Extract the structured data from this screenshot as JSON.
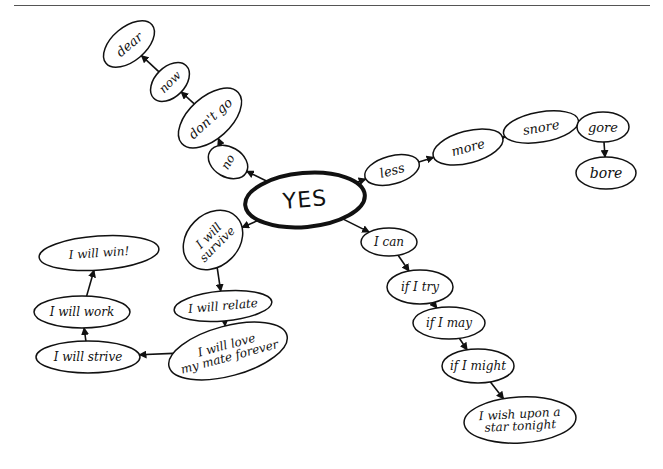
{
  "diagram": {
    "type": "mind-map",
    "style": "hand-drawn",
    "root": {
      "id": "yes",
      "label": "YES"
    },
    "colors": {
      "ink": "#111111",
      "background": "#ffffff",
      "rule": "#555555"
    },
    "nodes": [
      {
        "id": "yes",
        "label": "YES",
        "cx": 305,
        "cy": 200,
        "rx": 60,
        "ry": 27,
        "rot": -5,
        "font": 22,
        "root": true
      },
      {
        "id": "no",
        "label": "no",
        "cx": 228,
        "cy": 162,
        "rx": 15,
        "ry": 21,
        "rot": -60,
        "font": 12
      },
      {
        "id": "dont-go",
        "label": "don't go",
        "cx": 210,
        "cy": 118,
        "rx": 38,
        "ry": 21,
        "rot": -42,
        "font": 13
      },
      {
        "id": "now",
        "label": "now",
        "cx": 170,
        "cy": 82,
        "rx": 23,
        "ry": 15,
        "rot": -45,
        "font": 12
      },
      {
        "id": "dear",
        "label": "dear",
        "cx": 129,
        "cy": 44,
        "rx": 30,
        "ry": 17,
        "rot": -40,
        "font": 13
      },
      {
        "id": "less",
        "label": "less",
        "cx": 392,
        "cy": 170,
        "rx": 28,
        "ry": 14,
        "rot": -15,
        "font": 13
      },
      {
        "id": "more",
        "label": "more",
        "cx": 468,
        "cy": 147,
        "rx": 36,
        "ry": 16,
        "rot": -15,
        "font": 13
      },
      {
        "id": "snore",
        "label": "snore",
        "cx": 541,
        "cy": 127,
        "rx": 38,
        "ry": 15,
        "rot": -10,
        "font": 13
      },
      {
        "id": "gore",
        "label": "gore",
        "cx": 603,
        "cy": 127,
        "rx": 26,
        "ry": 15,
        "rot": 0,
        "font": 13
      },
      {
        "id": "bore",
        "label": "bore",
        "cx": 606,
        "cy": 173,
        "rx": 30,
        "ry": 16,
        "rot": 0,
        "font": 14
      },
      {
        "id": "i-can",
        "label": "I can",
        "cx": 389,
        "cy": 242,
        "rx": 28,
        "ry": 14,
        "rot": 0,
        "font": 12
      },
      {
        "id": "if-i-try",
        "label": "if I try",
        "cx": 420,
        "cy": 287,
        "rx": 33,
        "ry": 17,
        "rot": 0,
        "font": 12
      },
      {
        "id": "if-i-may",
        "label": "if I may",
        "cx": 449,
        "cy": 323,
        "rx": 36,
        "ry": 16,
        "rot": 0,
        "font": 12
      },
      {
        "id": "if-i-might",
        "label": "if I might",
        "cx": 478,
        "cy": 366,
        "rx": 36,
        "ry": 17,
        "rot": 0,
        "font": 12
      },
      {
        "id": "wish",
        "label": "I wish upon a\nstar tonight",
        "cx": 520,
        "cy": 420,
        "rx": 56,
        "ry": 23,
        "rot": -3,
        "font": 12
      },
      {
        "id": "survive",
        "label": "I will\nsurvive",
        "cx": 213,
        "cy": 240,
        "rx": 33,
        "ry": 26,
        "rot": -45,
        "font": 12
      },
      {
        "id": "relate",
        "label": "I will relate",
        "cx": 223,
        "cy": 306,
        "rx": 49,
        "ry": 15,
        "rot": -5,
        "font": 12
      },
      {
        "id": "love",
        "label": "I will love\nmy mate forever",
        "cx": 228,
        "cy": 351,
        "rx": 61,
        "ry": 25,
        "rot": -15,
        "font": 12
      },
      {
        "id": "strive",
        "label": "I will strive",
        "cx": 88,
        "cy": 357,
        "rx": 52,
        "ry": 16,
        "rot": 0,
        "font": 12
      },
      {
        "id": "work",
        "label": "I will work",
        "cx": 82,
        "cy": 312,
        "rx": 48,
        "ry": 16,
        "rot": 0,
        "font": 12
      },
      {
        "id": "win",
        "label": "I will win!",
        "cx": 99,
        "cy": 253,
        "rx": 60,
        "ry": 17,
        "rot": -4,
        "font": 12
      }
    ],
    "edges": [
      {
        "from": "yes",
        "to": "no"
      },
      {
        "from": "no",
        "to": "dont-go"
      },
      {
        "from": "dont-go",
        "to": "now"
      },
      {
        "from": "now",
        "to": "dear"
      },
      {
        "from": "yes",
        "to": "less"
      },
      {
        "from": "less",
        "to": "more"
      },
      {
        "from": "more",
        "to": "snore"
      },
      {
        "from": "snore",
        "to": "gore"
      },
      {
        "from": "gore",
        "to": "bore"
      },
      {
        "from": "yes",
        "to": "i-can"
      },
      {
        "from": "i-can",
        "to": "if-i-try"
      },
      {
        "from": "if-i-try",
        "to": "if-i-may"
      },
      {
        "from": "if-i-may",
        "to": "if-i-might"
      },
      {
        "from": "if-i-might",
        "to": "wish"
      },
      {
        "from": "yes",
        "to": "survive"
      },
      {
        "from": "survive",
        "to": "relate"
      },
      {
        "from": "relate",
        "to": "love"
      },
      {
        "from": "love",
        "to": "strive"
      },
      {
        "from": "strive",
        "to": "work"
      },
      {
        "from": "work",
        "to": "win"
      }
    ]
  },
  "labels": {
    "root": "YES",
    "branch_up": [
      "no",
      "don't go",
      "now",
      "dear"
    ],
    "branch_right": [
      "less",
      "more",
      "snore",
      "gore",
      "bore"
    ],
    "branch_down_right": [
      "I can",
      "if I try",
      "if I may",
      "if I might",
      "I wish upon a star tonight"
    ],
    "branch_down_left": [
      "I will survive",
      "I will relate",
      "I will love my mate forever",
      "I will strive",
      "I will work",
      "I will win!"
    ]
  }
}
